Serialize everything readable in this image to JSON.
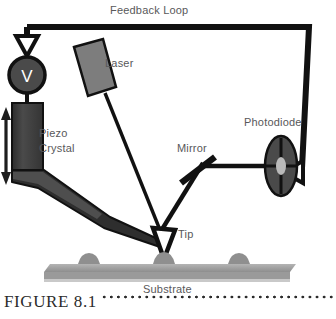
{
  "figure": {
    "caption_label": "FIGURE 8.1",
    "leader_style": "dotted"
  },
  "diagram": {
    "type": "schematic",
    "labels": {
      "feedback_loop": "Feedback Loop",
      "laser": "Laser",
      "photodiode": "Photodiode",
      "mirror": "Mirror",
      "piezo_crystal_line1": "Piezo",
      "piezo_crystal_line2": "Crystal",
      "tip": "Tip",
      "substrate": "Substrate",
      "voltage_symbol": "V"
    },
    "colors": {
      "stroke": "#111111",
      "label_text": "#58585a",
      "caption_text": "#2b2b2b",
      "voltage_circle_fill": "#4a4a4a",
      "voltage_glyph": "#ffffff",
      "laser_body_fill": "#7d7d7d",
      "piezo_fill": "#3f3f3f",
      "cantilever_fill": "#2e2e2e",
      "photodiode_fill": "#4a4a4a",
      "photodiode_center": "#b9b9b9",
      "substrate_fill": "#9a9a9a",
      "substrate_top_fill": "#c4c4c4",
      "substrate_bump_fill": "#8f8f8f",
      "background": "#ffffff"
    }
  }
}
